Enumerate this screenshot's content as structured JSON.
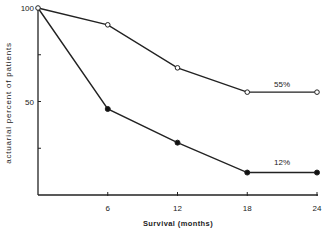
{
  "chart_data": {
    "type": "line",
    "title": "",
    "xlabel": "Survival   (months)",
    "ylabel": "actuarial  percent  of  patients",
    "x": [
      0,
      6,
      12,
      18,
      24
    ],
    "xlim": [
      0,
      24
    ],
    "ylim": [
      0,
      100
    ],
    "x_ticks": [
      "6",
      "12",
      "18",
      "24"
    ],
    "y_ticks": [
      "100",
      "50"
    ],
    "grid": false,
    "legend": null,
    "series": [
      {
        "name": "open-markers",
        "marker": "open-circle",
        "values": [
          100,
          91,
          68,
          55,
          55
        ]
      },
      {
        "name": "filled-markers",
        "marker": "filled-circle",
        "values": [
          100,
          46,
          28,
          12,
          12
        ]
      }
    ],
    "annotations": [
      {
        "text": "55%",
        "x": 21,
        "y": 58
      },
      {
        "text": "12%",
        "x": 21,
        "y": 16
      }
    ]
  }
}
